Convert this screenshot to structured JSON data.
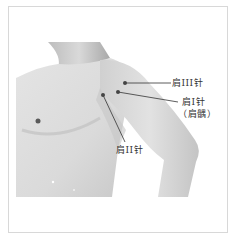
{
  "figure": {
    "colors": {
      "background": "#ffffff",
      "frame_border": "#d8d8d8",
      "skin_light": "#e6e6e6",
      "skin_mid": "#cfcfcf",
      "skin_dark": "#b0b0b0",
      "point": "#444444",
      "leader": "#333333"
    },
    "points": [
      {
        "id": "jian-iii",
        "label": "肩III针",
        "x": 125,
        "y": 83
      },
      {
        "id": "jian-i",
        "label": "肩I针",
        "sub_label": "（肩髃）",
        "x": 118,
        "y": 92
      },
      {
        "id": "jian-ii",
        "label": "肩II针",
        "x": 103,
        "y": 95
      }
    ]
  }
}
